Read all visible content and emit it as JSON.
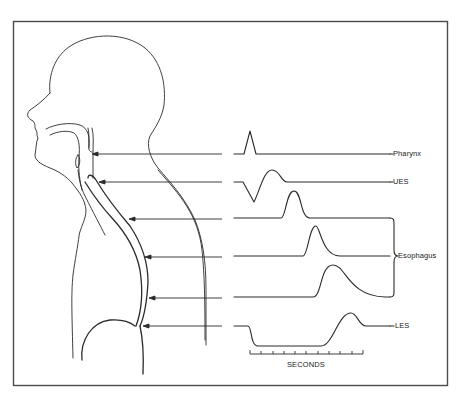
{
  "figure": {
    "labels": {
      "pharynx": "Pharynx",
      "ues": "UES",
      "esophagus": "Esophagus",
      "les": "LES",
      "seconds": "SECONDS"
    },
    "colors": {
      "ink": "#2a2a2a",
      "frame": "#4a4a4a",
      "background": "#ffffff"
    },
    "scale": {
      "ticks": 11
    }
  }
}
